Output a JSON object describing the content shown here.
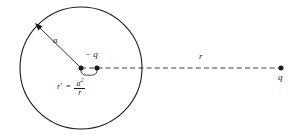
{
  "figure": {
    "background_color": "#ffffff",
    "stroke_color": "#1a1a1a",
    "title": "",
    "labels": {
      "radius": "a",
      "image_charge": "− q",
      "distance": "r",
      "source_charge": "q",
      "image_distance_lhs": "r′",
      "image_distance_eq": "=",
      "image_distance_numerator": "a",
      "image_distance_numerator_exponent": "2",
      "image_distance_denominator": "r"
    },
    "geometry": {
      "circle_center_x": 81,
      "circle_center_y": 68,
      "circle_radius": 61,
      "center_dot_x": 81,
      "center_dot_y": 68,
      "image_charge_dot_x": 97,
      "image_charge_dot_y": 68,
      "source_charge_dot_x": 281,
      "source_charge_dot_y": 68,
      "dashed_line_y": 68,
      "radius_arrow_tip_x": 36,
      "radius_arrow_tip_y": 24
    }
  }
}
